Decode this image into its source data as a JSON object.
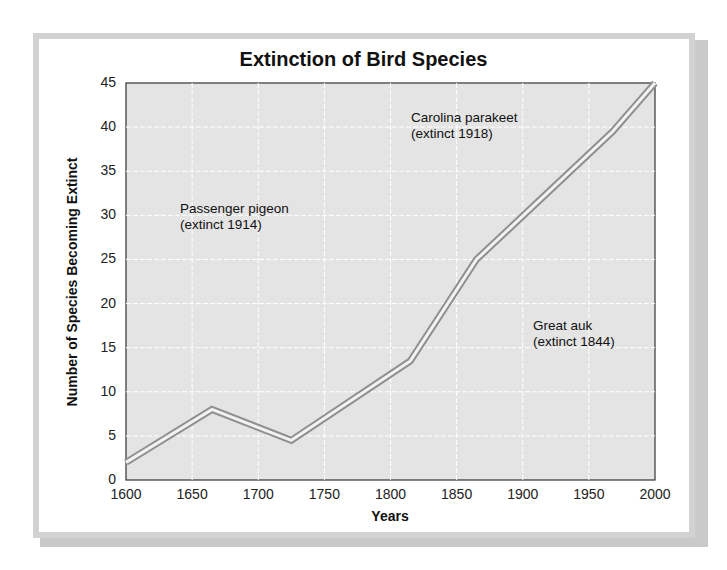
{
  "chart_data": {
    "type": "line",
    "title": "Extinction of Bird Species",
    "xlabel": "Years",
    "ylabel": "Number of Species Becoming Extinct",
    "xlim": [
      1600,
      2000
    ],
    "ylim": [
      0,
      45
    ],
    "x_ticks": [
      1600,
      1650,
      1700,
      1750,
      1800,
      1850,
      1900,
      1950,
      2000
    ],
    "y_ticks": [
      0,
      5,
      10,
      15,
      20,
      25,
      30,
      35,
      40,
      45
    ],
    "grid": true,
    "x": [
      1600,
      1665,
      1725,
      1815,
      1865,
      1968,
      2000
    ],
    "values": [
      2,
      8,
      4.5,
      13.5,
      25,
      39.5,
      45
    ],
    "annotations": [
      {
        "label": "Passenger pigeon",
        "sub": "(extinct 1914)"
      },
      {
        "label": "Carolina parakeet",
        "sub": "(extinct 1918)"
      },
      {
        "label": "Great auk",
        "sub": "(extinct 1844)"
      }
    ]
  }
}
